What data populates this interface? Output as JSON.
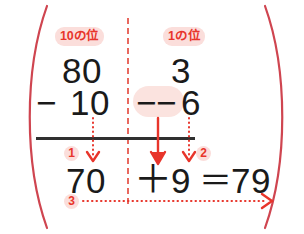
{
  "figure": {
    "colors": {
      "accent_red": "#e8352b",
      "arc_red": "#cf4550",
      "divider_red": "#e8685f",
      "badge_bg": "#fbdedb",
      "highlight_bg": "#fbe3df",
      "ink_black": "#1a1a1a"
    }
  },
  "labels": {
    "tens_place": "10の位",
    "ones_place": "1の位"
  },
  "columns": {
    "tens": {
      "minuend": "80",
      "operator": "−",
      "subtrahend": "10",
      "result": "70"
    },
    "ones": {
      "minuend": "3",
      "operator_a": "−",
      "operator_b": "−",
      "subtrahend": "6",
      "result": "9"
    }
  },
  "answer_row": {
    "tens_result": "70",
    "plus": "＋",
    "ones_result": "9",
    "equals": "＝",
    "total": "79"
  },
  "steps": {
    "step_1": "1",
    "step_2": "2",
    "step_3": "3"
  },
  "annotations": {
    "arrow_tens_down": "dotted-down-arrow",
    "arrow_ones_down": "dotted-down-arrow",
    "arrow_borrow": "solid-down-arrow",
    "arrow_combine": "dotted-right-arrow"
  },
  "decorations": {
    "left_brace": "left-arc",
    "right_brace": "right-arc",
    "place_divider": "vertical-dashed-line",
    "subtraction_rule": "horizontal-rule"
  }
}
